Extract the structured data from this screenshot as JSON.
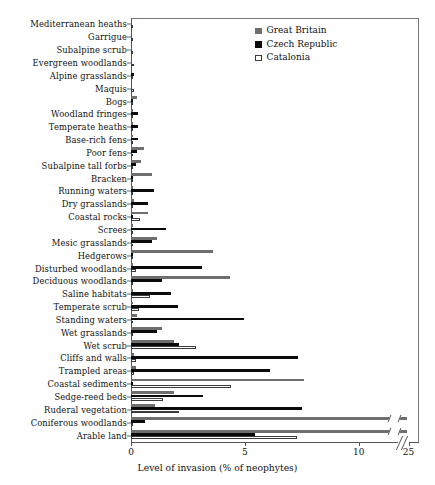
{
  "chart_data": {
    "type": "bar",
    "orientation": "horizontal",
    "title": "",
    "xlabel": "Level of invasion (% of neophytes)",
    "ylabel": "",
    "xlim": [
      0,
      25
    ],
    "xticks": [
      0,
      5,
      10,
      25
    ],
    "xtick_labels": [
      "0",
      "5",
      "10",
      "25"
    ],
    "axis_break": {
      "after": 11.5,
      "resumes_at": 24.2,
      "label": "//"
    },
    "grid": false,
    "legend_position": "top-right",
    "categories": [
      "Mediterranean heaths",
      "Garrigue",
      "Subalpine scrub",
      "Evergreen woodlands",
      "Alpine grasslands",
      "Maquis",
      "Bogs",
      "Woodland fringes",
      "Temperate heaths",
      "Base-rich fens",
      "Poor fens",
      "Subalpine tall forbs",
      "Bracken",
      "Running waters",
      "Dry grasslands",
      "Coastal rocks",
      "Screes",
      "Mesic grasslands",
      "Hedgerows",
      "Disturbed woodlands",
      "Deciduous woodlands",
      "Saline habitats",
      "Temperate scrub",
      "Standing waters",
      "Wet grasslands",
      "Wet scrub",
      "Cliffs and walls",
      "Trampled areas",
      "Coastal sediments",
      "Sedge-reed beds",
      "Ruderal vegetation",
      "Coniferous woodlands",
      "Arable land"
    ],
    "series": [
      {
        "name": "Great Britain",
        "color": "#6e6e6e",
        "values": [
          0,
          0,
          0,
          0,
          0,
          0,
          0.25,
          0.1,
          0.1,
          0.1,
          0.55,
          0.45,
          0.9,
          0.1,
          0.15,
          0.75,
          0.1,
          1.15,
          3.6,
          0.1,
          4.35,
          0.1,
          0.1,
          0.25,
          1.35,
          1.9,
          0.15,
          0.2,
          7.6,
          1.9,
          1.05,
          24.3,
          24.1
        ]
      },
      {
        "name": "Czech Republic",
        "color": "#0a0a0a",
        "values": [
          0,
          0,
          0,
          0,
          0.15,
          0,
          0.1,
          0.3,
          0.3,
          0.3,
          0.25,
          0.2,
          0.1,
          1.0,
          0.75,
          0.1,
          1.55,
          0.9,
          0.1,
          3.1,
          1.35,
          1.75,
          2.05,
          4.95,
          1.15,
          2.1,
          7.35,
          6.1,
          0.1,
          3.15,
          7.5,
          0.6,
          5.45
        ]
      },
      {
        "name": "Catalonia",
        "color": "#ffffff",
        "values": [
          0,
          0,
          0,
          0.15,
          0,
          0.15,
          0,
          0,
          0,
          0,
          0,
          0,
          0,
          0,
          0,
          0.4,
          0,
          0.1,
          0,
          0.2,
          0.1,
          0.85,
          0.35,
          0.1,
          0.05,
          2.85,
          0.2,
          0.15,
          4.4,
          1.4,
          2.1,
          0.05,
          7.3
        ]
      }
    ]
  },
  "legend": {
    "items": [
      {
        "label": "Great Britain",
        "swatch": "filled-gray-square-icon"
      },
      {
        "label": "Czech Republic",
        "swatch": "filled-black-square-icon"
      },
      {
        "label": "Catalonia",
        "swatch": "outline-white-square-icon"
      }
    ]
  }
}
